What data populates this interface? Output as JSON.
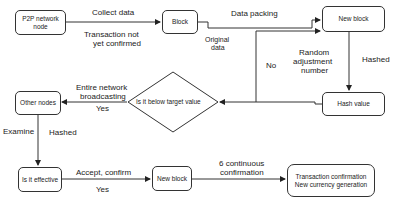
{
  "nodes": {
    "p2p": "P2P network node",
    "block": "Block",
    "new_block_top": "New block",
    "hash_value": "Hash value",
    "decision": "Is it below target value",
    "other_nodes": "Other nodes",
    "is_effective": "Is it effective",
    "new_block_bottom": "New block",
    "final": "Transaction confirmation New currency generation"
  },
  "edges": {
    "collect_data": "Collect data",
    "tx_not_confirmed_1": "Transaction not",
    "tx_not_confirmed_2": "yet confirmed",
    "data_packing": "Data packing",
    "original_data_1": "Original",
    "original_data_2": "data",
    "no": "No",
    "random_1": "Random",
    "random_2": "adjustment",
    "random_3": "number",
    "hashed_right": "Hashed",
    "broadcast_1": "Entire network",
    "broadcast_2": "broadcasting",
    "yes_left": "Yes",
    "examine": "Examine",
    "hashed_left": "Hashed",
    "accept_confirm": "Accept, confirm",
    "yes_bottom": "Yes",
    "six_conf_1": "6 continuous",
    "six_conf_2": "confirmation"
  }
}
